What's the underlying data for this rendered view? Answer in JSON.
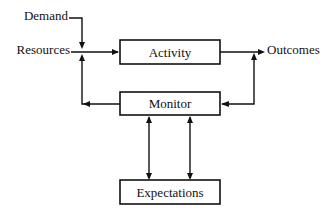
{
  "diagram": {
    "nodes": [
      {
        "id": "activity",
        "label": "Activity"
      },
      {
        "id": "monitor",
        "label": "Monitor"
      },
      {
        "id": "expectations",
        "label": "Expectations"
      }
    ],
    "inputs": [
      {
        "id": "demand",
        "label": "Demand"
      },
      {
        "id": "resources",
        "label": "Resources"
      }
    ],
    "outputs": [
      {
        "id": "outcomes",
        "label": "Outcomes"
      }
    ],
    "edges": [
      {
        "from": "demand",
        "to": "activity"
      },
      {
        "from": "resources",
        "to": "activity"
      },
      {
        "from": "activity",
        "to": "outcomes"
      },
      {
        "from": "outcomes",
        "to": "monitor"
      },
      {
        "from": "monitor",
        "to": "resources"
      },
      {
        "from": "monitor",
        "to": "expectations"
      },
      {
        "from": "expectations",
        "to": "monitor"
      }
    ]
  }
}
